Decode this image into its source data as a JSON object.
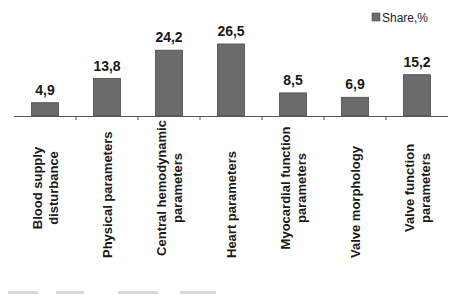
{
  "chart_data": {
    "type": "bar",
    "title": "",
    "xlabel": "",
    "ylabel": "",
    "categories": [
      [
        "Blood supply",
        "disturbance"
      ],
      [
        "Physical parameters"
      ],
      [
        "Central hemodynamic",
        "parameters"
      ],
      [
        "Heart parameters"
      ],
      [
        "Myocardial function",
        "parameters"
      ],
      [
        "Valve morphology"
      ],
      [
        "Valve function",
        "parameters"
      ]
    ],
    "series": [
      {
        "name": "Share,%",
        "values": [
          4.9,
          13.8,
          24.2,
          26.5,
          8.5,
          6.9,
          15.2
        ],
        "value_labels": [
          "4,9",
          "13,8",
          "24,2",
          "26,5",
          "8,5",
          "6,9",
          "15,2"
        ],
        "color": "#6b6b6b"
      }
    ],
    "ylim": [
      0,
      30
    ],
    "grid": false,
    "y_axis_visible": false,
    "legend": {
      "position": "top-right",
      "entries": [
        "Share,%"
      ]
    },
    "axis_color": "#555555"
  }
}
